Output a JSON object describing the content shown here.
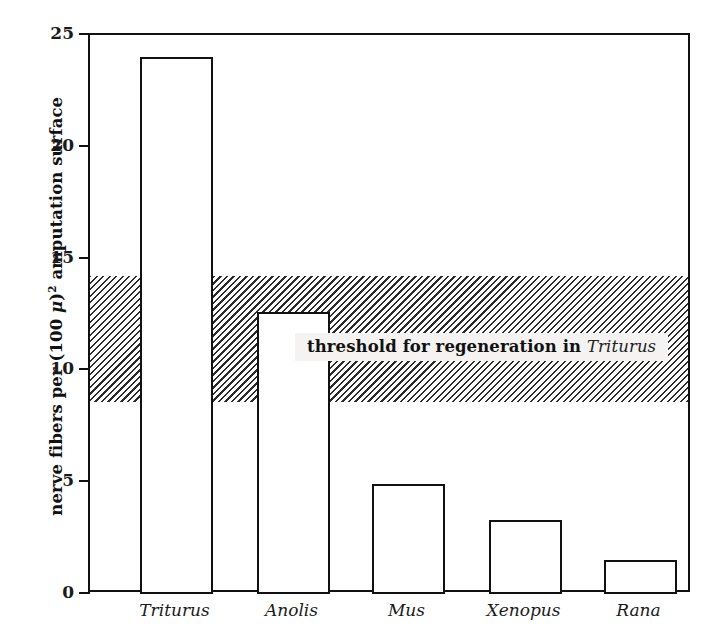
{
  "chart_data": {
    "type": "bar",
    "title": "",
    "xlabel": "",
    "ylabel": "nerve fibers per (100 μ)² amputation surface",
    "ylabel_parts": {
      "pre": "nerve fibers per (100 ",
      "mu": "μ",
      "post": ")",
      "exponent": "2",
      "tail": " amputation surface"
    },
    "categories": [
      "Triturus",
      "Anolis",
      "Mus",
      "Xenopus",
      "Rana"
    ],
    "values": [
      24.0,
      12.6,
      4.9,
      3.3,
      1.5
    ],
    "ylim": [
      0,
      25
    ],
    "yticks": [
      0,
      5,
      10,
      15,
      20,
      25
    ],
    "ytick_labels": [
      "0",
      "5",
      "10",
      "15",
      "20",
      "25"
    ],
    "grid": false,
    "legend": "none",
    "bar_style": {
      "fill": "#ffffff",
      "edge": "#111111"
    },
    "annotations": [
      {
        "name": "threshold-band",
        "type": "hspan",
        "y_from": 8.6,
        "y_to": 14.2,
        "style": "diagonal-hatch",
        "color": "#2b2b2b"
      },
      {
        "name": "threshold-text",
        "type": "text",
        "text": "threshold for regeneration in Triturus",
        "text_bold": "threshold for regeneration in",
        "text_italic": "Triturus",
        "y": 11.0
      }
    ]
  },
  "axes": {
    "y_axis_title": "nerve fibers per (100 μ)² amputation surface",
    "tick_0": "0",
    "tick_5": "5",
    "tick_10": "10",
    "tick_15": "15",
    "tick_20": "20",
    "tick_25": "25"
  },
  "xlabels": {
    "c0": "Triturus",
    "c1": "Anolis",
    "c2": "Mus",
    "c3": "Xenopus",
    "c4": "Rana"
  },
  "threshold": {
    "bold_text": "threshold for regeneration in",
    "italic_species": "Triturus"
  }
}
